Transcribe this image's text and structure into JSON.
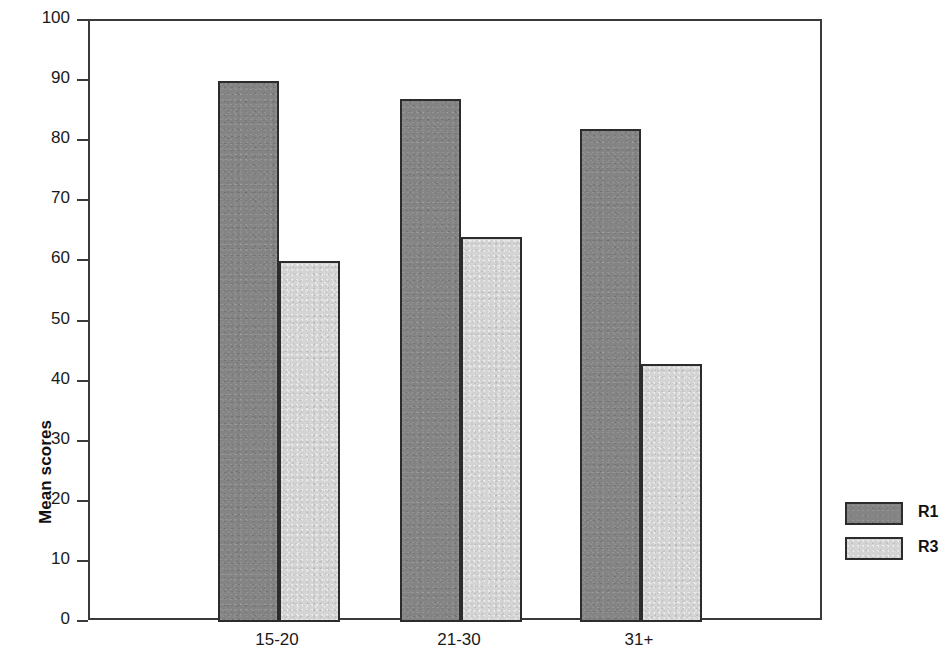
{
  "chart_data": {
    "type": "bar",
    "title": "",
    "subtitle": "",
    "xlabel": "",
    "ylabel": "Mean scores",
    "categories": [
      "15-20",
      "21-30",
      "31+"
    ],
    "series": [
      {
        "name": "R1",
        "color": "#848484",
        "values": [
          90,
          87,
          82
        ]
      },
      {
        "name": "R3",
        "color": "#d4d4d4",
        "values": [
          60,
          64,
          43
        ]
      }
    ],
    "ylim": [
      0,
      100
    ],
    "ytick_step": 10,
    "yticks": [
      "100",
      "90",
      "80",
      "70",
      "60",
      "50",
      "40",
      "30",
      "20",
      "10",
      "0"
    ],
    "grid": false,
    "legend_position": "right-outside",
    "bar_border_color": "#2c2c2c",
    "axis_color": "#3a3a3a",
    "background": "#ffffff"
  },
  "legend": {
    "entries": [
      {
        "label": "R1",
        "series": "r1"
      },
      {
        "label": "R3",
        "series": "r3"
      }
    ]
  }
}
